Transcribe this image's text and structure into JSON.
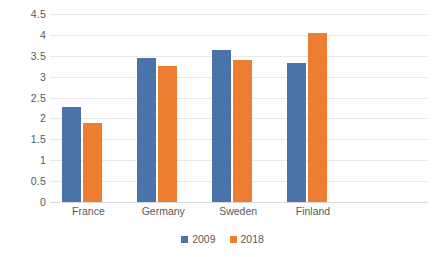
{
  "chart_data": {
    "type": "bar",
    "title": "",
    "xlabel": "",
    "ylabel": "",
    "categories": [
      "France",
      "Germany",
      "Sweden",
      "Finland"
    ],
    "series": [
      {
        "name": "2009",
        "color": "#4a72ab",
        "values": [
          2.27,
          3.45,
          3.64,
          3.32
        ]
      },
      {
        "name": "2018",
        "color": "#ed7d31",
        "values": [
          1.88,
          3.25,
          3.4,
          4.05
        ]
      }
    ],
    "ylim": [
      0,
      4.5
    ],
    "yticks": [
      "0",
      "0.5",
      "1",
      "1.5",
      "2",
      "2.5",
      "3",
      "3.5",
      "4",
      "4.5"
    ],
    "ytick_values": [
      0,
      0.5,
      1,
      1.5,
      2,
      2.5,
      3,
      3.5,
      4,
      4.5
    ],
    "grid": true,
    "legend_position": "bottom",
    "background_color": "#ffffff",
    "gridline_color": "#e9e9ed",
    "text_color": "#5a5a5a"
  }
}
